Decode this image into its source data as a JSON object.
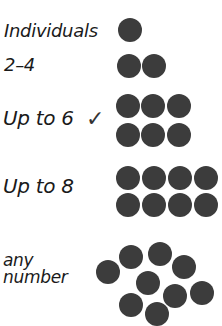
{
  "colors": {
    "dot": "#3c3c3c",
    "text": "#1a1a1a"
  },
  "rows": [
    {
      "label": "Individuals",
      "selected": false,
      "dots": [
        [
          130,
          30
        ]
      ]
    },
    {
      "label": "2–4",
      "selected": false,
      "dots": [
        [
          129,
          66
        ],
        [
          154,
          66
        ]
      ]
    },
    {
      "label": "Up to 6",
      "selected": true,
      "check": "✓",
      "dots": [
        [
          128,
          106
        ],
        [
          153,
          106
        ],
        [
          179,
          106
        ],
        [
          128,
          135
        ],
        [
          153,
          135
        ],
        [
          179,
          135
        ]
      ]
    },
    {
      "label": "Up to 8",
      "selected": false,
      "dots": [
        [
          128,
          178
        ],
        [
          154,
          178
        ],
        [
          180,
          178
        ],
        [
          206,
          178
        ],
        [
          128,
          205
        ],
        [
          154,
          205
        ],
        [
          180,
          205
        ],
        [
          206,
          205
        ]
      ]
    },
    {
      "label": "any number",
      "label_line1": "any",
      "label_line2": "number",
      "selected": false,
      "dots": [
        [
          108,
          272
        ],
        [
          131,
          257
        ],
        [
          160,
          254
        ],
        [
          184,
          267
        ],
        [
          148,
          283
        ],
        [
          202,
          293
        ],
        [
          175,
          296
        ],
        [
          131,
          305
        ],
        [
          157,
          314
        ]
      ]
    }
  ]
}
